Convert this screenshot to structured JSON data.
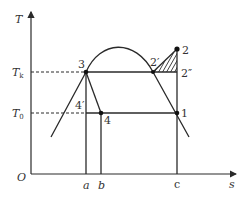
{
  "axes": {
    "y_label": "T",
    "x_label": "s",
    "origin_label": "O"
  },
  "temperature_levels": {
    "Tk": {
      "label": "T",
      "subscript": "k"
    },
    "T0": {
      "label": "T",
      "subscript": "0"
    }
  },
  "points": {
    "p1": "1",
    "p2": "2",
    "p2prime": "2′",
    "p2dprime": "2″",
    "p3": "3",
    "p4": "4",
    "p4prime": "4′"
  },
  "x_ticks": {
    "a": "a",
    "b": "b",
    "c": "c"
  },
  "colors": {
    "line": "#2a2a2a",
    "text": "#333333",
    "background": "#ffffff"
  }
}
